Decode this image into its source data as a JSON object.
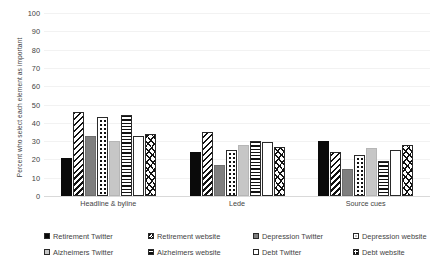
{
  "chart_data": {
    "type": "bar",
    "title": "",
    "xlabel": "",
    "ylabel": "Percent who select each element as important",
    "ylim": [
      0,
      100
    ],
    "yticks": [
      0,
      10,
      20,
      30,
      40,
      50,
      60,
      70,
      80,
      90,
      100
    ],
    "grid": true,
    "legend_position": "bottom",
    "categories": [
      "Headline & byline",
      "Lede",
      "Source cues"
    ],
    "series": [
      {
        "name": "Retirement Twitter",
        "pattern": "solid-black",
        "values": [
          21,
          24,
          30
        ]
      },
      {
        "name": "Retirement website",
        "pattern": "diagonal-stripes",
        "values": [
          46,
          35,
          24
        ]
      },
      {
        "name": "Depression Twitter",
        "pattern": "solid-dark-gray",
        "values": [
          33,
          17,
          14.5
        ]
      },
      {
        "name": "Depression website",
        "pattern": "dots",
        "values": [
          43,
          25,
          22.5
        ]
      },
      {
        "name": "Alzheimers Twitter",
        "pattern": "solid-light-gray",
        "values": [
          30,
          28,
          26.5
        ]
      },
      {
        "name": "Alzheimers website",
        "pattern": "horizontal-lines",
        "values": [
          44,
          30,
          19
        ]
      },
      {
        "name": "Debt Twitter",
        "pattern": "white-empty",
        "values": [
          33,
          29.5,
          25
        ]
      },
      {
        "name": "Debt website",
        "pattern": "crosshatch",
        "values": [
          34,
          27,
          28
        ]
      }
    ]
  },
  "colors": {
    "solid_black": "#0a0a0a",
    "dark_gray": "#7f7f7f",
    "light_gray": "#c6c6c6",
    "white": "#ffffff",
    "gridline": "#f2f2f2",
    "axis": "#d9d9d9",
    "text": "#3f3f3f"
  }
}
